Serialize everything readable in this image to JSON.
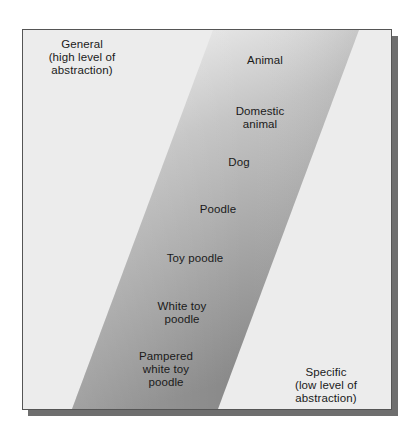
{
  "diagram": {
    "type": "abstraction-ladder",
    "colors": {
      "frame_bg": "#ececec",
      "band_top": "#f2f2f2",
      "band_bottom": "#8a8a8a",
      "shadow": "#6e6e6e",
      "text": "#1a1a1a"
    },
    "corner_labels": {
      "general": "General\n(high level of\nabstraction)",
      "specific": "Specific\n(low level of\nabstraction)"
    },
    "ladder_items": [
      {
        "label": "Animal"
      },
      {
        "label": "Domestic\nanimal"
      },
      {
        "label": "Dog"
      },
      {
        "label": "Poodle"
      },
      {
        "label": "Toy poodle"
      },
      {
        "label": "White toy\npoodle"
      },
      {
        "label": "Pampered\nwhite toy\npoodle"
      }
    ]
  }
}
